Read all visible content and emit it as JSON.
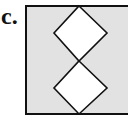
{
  "figure": {
    "label": "c.",
    "colors": {
      "background": "#ffffff",
      "box_fill": "#e2e2e2",
      "stroke": "#111111",
      "diamond_fill": "#ffffff"
    },
    "box": {
      "x": 26,
      "y": 6,
      "width": 106,
      "height": 108
    },
    "diamonds": [
      {
        "name": "upper",
        "top": [
          79,
          6
        ],
        "right": [
          107,
          33
        ],
        "bottom": [
          79,
          61
        ],
        "left": [
          54,
          33
        ]
      },
      {
        "name": "lower",
        "top": [
          79,
          61
        ],
        "right": [
          107,
          88
        ],
        "bottom": [
          79,
          114
        ],
        "left": [
          54,
          88
        ]
      }
    ]
  }
}
